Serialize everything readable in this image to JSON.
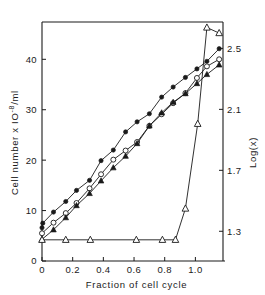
{
  "chart_data": {
    "type": "line",
    "title": "",
    "xlabel": "Fraction of cell cycle",
    "ylabel": "Cell number x 10-8/ml",
    "ylabel_parts": {
      "prefix": "Cell  number  x  IO",
      "exponent": "-8",
      "suffix": "/ml"
    },
    "y2label": "Log(x)",
    "xlim": [
      0,
      1.18
    ],
    "ylim": [
      0,
      47
    ],
    "y2lim": [
      1.105,
      2.66
    ],
    "grid": false,
    "legend": "none",
    "xticks": [
      "0",
      "0.2",
      "0.4",
      "0.6",
      "0.8",
      "1.0"
    ],
    "xtick_values": [
      0,
      0.2,
      0.4,
      0.6,
      0.8,
      1.0
    ],
    "yticks": [
      "0",
      "10",
      "20",
      "30",
      "40"
    ],
    "ytick_values": [
      0,
      10,
      20,
      30,
      40
    ],
    "y2ticks": [
      "1.3",
      "1.7",
      "2.1",
      "2.5"
    ],
    "y2tick_values": [
      1.3,
      1.7,
      2.1,
      2.5
    ],
    "series": [
      {
        "name": "filled-circles-upper",
        "marker": "filled-circle",
        "x": [
          0.0,
          0.005,
          0.075,
          0.155,
          0.225,
          0.31,
          0.385,
          0.465,
          0.545,
          0.62,
          0.7,
          0.78,
          0.855,
          0.935,
          1.01,
          1.075,
          1.155
        ],
        "values": [
          6.6,
          7.5,
          9.7,
          11.8,
          14.0,
          16.0,
          19.9,
          22.0,
          25.6,
          27.6,
          29.2,
          32.5,
          34.5,
          36.4,
          38.1,
          39.6,
          42.1
        ]
      },
      {
        "name": "open-circles-middle",
        "marker": "open-circle",
        "x": [
          0.0,
          0.075,
          0.155,
          0.225,
          0.31,
          0.385,
          0.465,
          0.545,
          0.62,
          0.7,
          0.78,
          0.855,
          0.935,
          1.01,
          1.075,
          1.155
        ],
        "values": [
          5.5,
          7.6,
          9.5,
          11.5,
          14.4,
          17.2,
          20.1,
          21.9,
          23.6,
          26.8,
          29.1,
          31.3,
          33.3,
          36.3,
          38.6,
          40.0
        ]
      },
      {
        "name": "filled-triangles-lower",
        "marker": "filled-triangle",
        "x": [
          0.0,
          0.075,
          0.155,
          0.225,
          0.31,
          0.385,
          0.465,
          0.545,
          0.62,
          0.7,
          0.78,
          0.855,
          0.935,
          1.01,
          1.075,
          1.155
        ],
        "values": [
          4.3,
          6.2,
          8.6,
          11.0,
          13.4,
          15.9,
          18.5,
          20.8,
          23.3,
          26.8,
          29.4,
          31.5,
          33.2,
          35.2,
          37.0,
          38.9
        ]
      },
      {
        "name": "open-triangles-step",
        "marker": "open-triangle",
        "x": [
          0.0,
          0.155,
          0.315,
          0.615,
          0.785,
          0.87,
          0.935,
          1.015,
          1.075,
          1.155
        ],
        "values": [
          4.2,
          4.2,
          4.2,
          4.2,
          4.2,
          4.2,
          10.4,
          27.2,
          46.3,
          45.2
        ]
      }
    ]
  }
}
